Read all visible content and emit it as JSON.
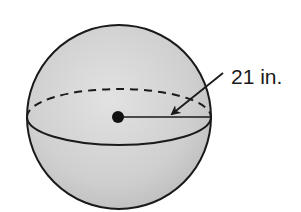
{
  "diagram": {
    "type": "sphere",
    "shape": {
      "center": [
        119,
        117
      ],
      "radius": 92,
      "equator_ry": 28,
      "fill_light": "#dedede",
      "fill_dark": "#bcbcbc",
      "stroke": "#1a1a1a"
    },
    "center_point": {
      "cx": 118,
      "cy": 117,
      "r": 6
    },
    "radius_line": {
      "x1": 118,
      "y1": 117,
      "x2": 211,
      "y2": 117
    },
    "label": {
      "text": "21 in.",
      "x": 231,
      "y": 84
    },
    "arrow": {
      "from": [
        223,
        73
      ],
      "to": [
        170,
        116
      ]
    }
  }
}
